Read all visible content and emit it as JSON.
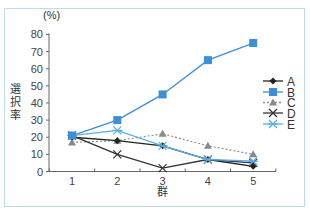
{
  "chart_data": {
    "type": "line",
    "title": "",
    "xlabel": "群",
    "ylabel": "選択率",
    "y_unit": "(%)",
    "categories": [
      "1",
      "2",
      "3",
      "4",
      "5"
    ],
    "ylim": [
      0,
      80
    ],
    "yticks": [
      0,
      10,
      20,
      30,
      40,
      50,
      60,
      70,
      80
    ],
    "grid": false,
    "legend_position": "right",
    "series": [
      {
        "name": "A",
        "color": "#222222",
        "marker": "diamond",
        "line": "solid",
        "values": [
          20,
          18,
          15,
          7,
          3
        ]
      },
      {
        "name": "B",
        "color": "#3a8fd6",
        "marker": "square",
        "line": "solid",
        "values": [
          21,
          30,
          45,
          65,
          75
        ]
      },
      {
        "name": "C",
        "color": "#8a8a8a",
        "marker": "triangle",
        "line": "dotted",
        "values": [
          17,
          18,
          22,
          15,
          10
        ]
      },
      {
        "name": "D",
        "color": "#333333",
        "marker": "x",
        "line": "solid",
        "values": [
          21,
          10,
          2,
          7,
          5
        ]
      },
      {
        "name": "E",
        "color": "#5aaee6",
        "marker": "asterisk",
        "line": "solid",
        "values": [
          21,
          24,
          15,
          7,
          6
        ]
      }
    ]
  },
  "labels": {
    "y_unit": "(%)",
    "y_title_chars": [
      "選",
      "択",
      "率"
    ],
    "x_title": "群"
  }
}
